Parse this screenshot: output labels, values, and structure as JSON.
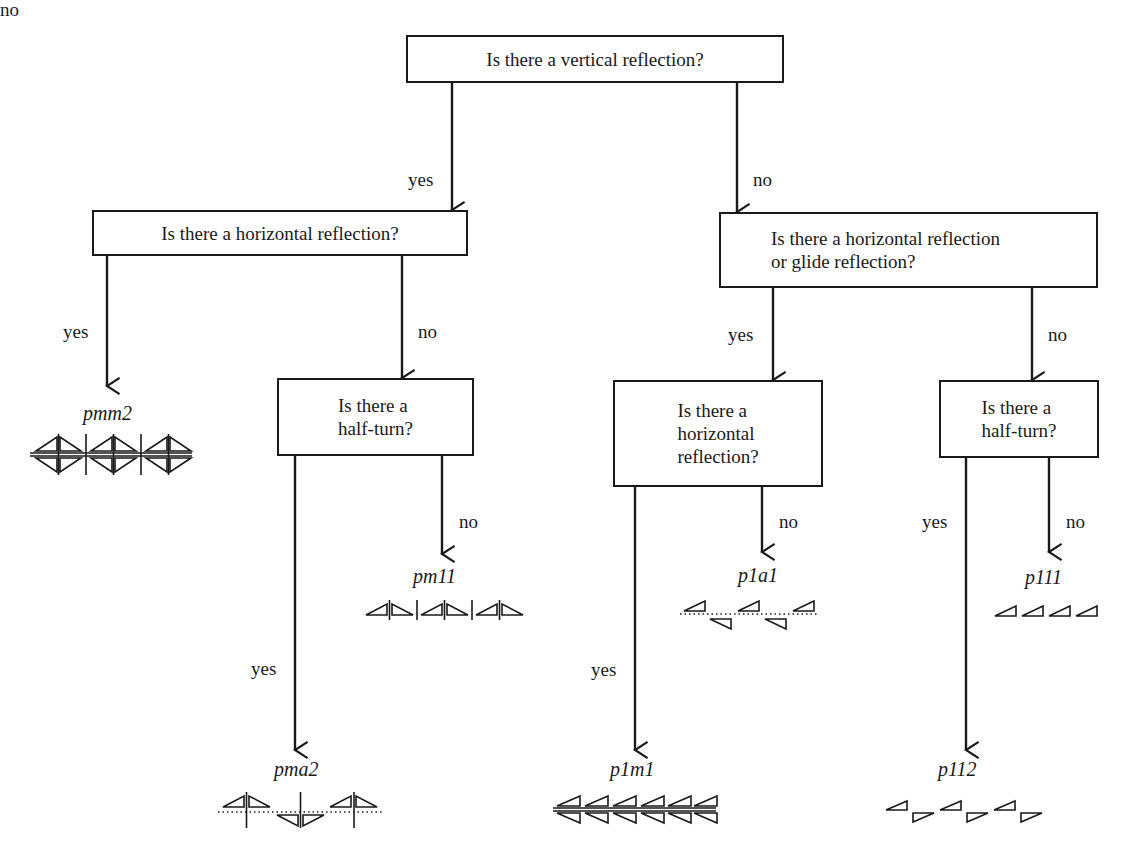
{
  "diagram": {
    "questions": {
      "q1": "Is there a vertical reflection?",
      "q2": "Is there a horizontal reflection?",
      "q3": "Is there a horizontal reflection\nor glide reflection?",
      "q4": "Is there a\nhalf-turn?",
      "q5": "Is there a\nhorizontal\nreflection?",
      "q6": "Is there a\nhalf-turn?"
    },
    "edge_labels": {
      "q1_yes": "yes",
      "q1_no": "no",
      "q2_yes": "yes",
      "q2_no": "no",
      "q3_yes": "yes",
      "q3_no": "no",
      "q4_yes": "yes",
      "q4_no": "no",
      "q5_yes": "yes",
      "q5_no": "no",
      "q6_yes": "yes",
      "q6_no": "no"
    },
    "results": {
      "pmm2": "pmm2",
      "pm11": "pm11",
      "pma2": "pma2",
      "p1a1": "p1a1",
      "p1m1": "p1m1",
      "p111": "p111",
      "p112": "p112"
    },
    "edges": [
      {
        "from": "q1",
        "to": "q2",
        "label": "yes"
      },
      {
        "from": "q1",
        "to": "q3",
        "label": "no"
      },
      {
        "from": "q2",
        "to": "pmm2",
        "label": "yes"
      },
      {
        "from": "q2",
        "to": "q4",
        "label": "no"
      },
      {
        "from": "q4",
        "to": "pma2",
        "label": "yes"
      },
      {
        "from": "q4",
        "to": "pm11",
        "label": "no"
      },
      {
        "from": "q3",
        "to": "q5",
        "label": "yes"
      },
      {
        "from": "q3",
        "to": "q6",
        "label": "no"
      },
      {
        "from": "q5",
        "to": "p1m1",
        "label": "yes"
      },
      {
        "from": "q5",
        "to": "p1a1",
        "label": "no"
      },
      {
        "from": "q6",
        "to": "p112",
        "label": "yes"
      },
      {
        "from": "q6",
        "to": "p111",
        "label": "no"
      }
    ],
    "colors": {
      "ink": "#1a1a1a",
      "background": "#ffffff"
    }
  }
}
